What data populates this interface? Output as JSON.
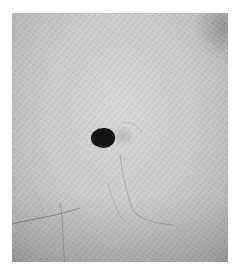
{
  "image": {
    "description": "Close-up grayscale photograph of skin with a single dark mole (nevus) near the center, a few fine hairs in the lower half",
    "subject": "dark mole on skin",
    "colors": {
      "background": "#ffffff",
      "skin_light": "#d6d6d6",
      "skin_dark": "#a9a9a9",
      "mole": "#111111"
    }
  }
}
